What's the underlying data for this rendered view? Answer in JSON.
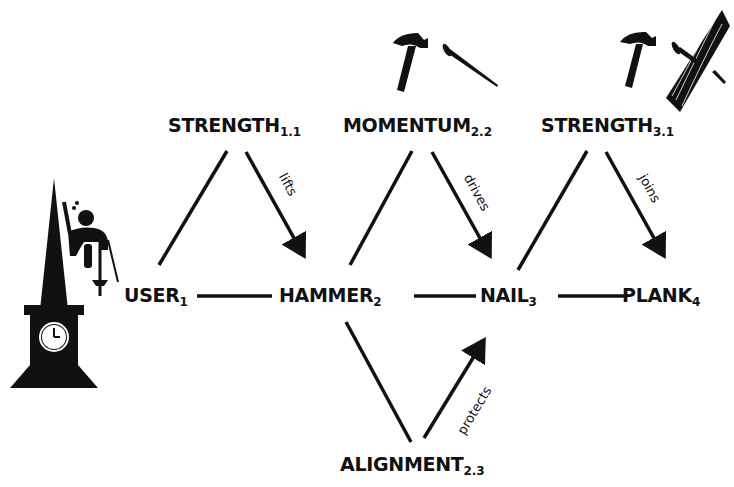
{
  "diagram": {
    "nodes": {
      "user": {
        "label": "USER",
        "sub": "1"
      },
      "hammer": {
        "label": "HAMMER",
        "sub": "2"
      },
      "nail": {
        "label": "NAIL",
        "sub": "3"
      },
      "plank": {
        "label": "PLANK",
        "sub": "4"
      },
      "strength1": {
        "label": "STRENGTH",
        "sub": "1.1"
      },
      "momentum": {
        "label": "MOMENTUM",
        "sub": "2.2"
      },
      "strength3": {
        "label": "STRENGTH",
        "sub": "3.1"
      },
      "alignment": {
        "label": "ALIGNMENT",
        "sub": "2.3"
      }
    },
    "edges": [
      {
        "from": "USER",
        "to": "HAMMER",
        "label": ""
      },
      {
        "from": "HAMMER",
        "to": "NAIL",
        "label": ""
      },
      {
        "from": "NAIL",
        "to": "PLANK",
        "label": ""
      },
      {
        "from": "USER",
        "to": "STRENGTH1.1",
        "label": ""
      },
      {
        "from": "STRENGTH1.1",
        "to": "HAMMER",
        "label": "lifts",
        "arrow": true
      },
      {
        "from": "HAMMER",
        "to": "MOMENTUM2.2",
        "label": ""
      },
      {
        "from": "MOMENTUM2.2",
        "to": "NAIL",
        "label": "drives",
        "arrow": true
      },
      {
        "from": "NAIL",
        "to": "STRENGTH3.1",
        "label": ""
      },
      {
        "from": "STRENGTH3.1",
        "to": "PLANK",
        "label": "joins",
        "arrow": true
      },
      {
        "from": "HAMMER",
        "to": "ALIGNMENT2.3",
        "label": ""
      },
      {
        "from": "ALIGNMENT2.3",
        "to": "NAIL",
        "label": "protects",
        "arrow": true
      }
    ],
    "edge_labels": {
      "lifts": "lifts",
      "drives": "drives",
      "joins": "joins",
      "protects": "protects"
    },
    "illustrations": [
      "clock-tower-climber",
      "hammer-and-nail",
      "hammer-nail-plank"
    ],
    "colors": {
      "ink": "#111111",
      "background": "#ffffff"
    }
  }
}
